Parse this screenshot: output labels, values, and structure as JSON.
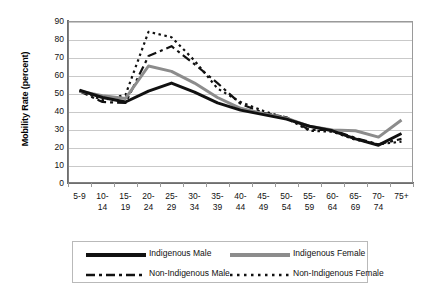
{
  "chart_data": {
    "type": "line",
    "title": "",
    "xlabel": "",
    "ylabel": "Mobility Rate (percent)",
    "ylim": [
      0,
      90
    ],
    "ytick_step": 10,
    "yticks": [
      90,
      80,
      70,
      60,
      50,
      40,
      30,
      20,
      10,
      0
    ],
    "grid": true,
    "legend_position": "bottom",
    "categories": [
      "5-9",
      "10-14",
      "15-19",
      "20-24",
      "25-29",
      "30-34",
      "35-39",
      "40-44",
      "45-49",
      "50-54",
      "55-59",
      "60-64",
      "65-69",
      "70-74",
      "75+"
    ],
    "category_lines": [
      [
        "5-9",
        ""
      ],
      [
        "10-",
        "14"
      ],
      [
        "15-",
        "19"
      ],
      [
        "20-",
        "24"
      ],
      [
        "25-",
        "29"
      ],
      [
        "30-",
        "34"
      ],
      [
        "35-",
        "39"
      ],
      [
        "40-",
        "44"
      ],
      [
        "45-",
        "49"
      ],
      [
        "50-",
        "54"
      ],
      [
        "55-",
        "59"
      ],
      [
        "60-",
        "64"
      ],
      [
        "65-",
        "69"
      ],
      [
        "70-",
        "74"
      ],
      [
        "75+",
        ""
      ]
    ],
    "series": [
      {
        "name": "Indigenous Male",
        "color": "#111111",
        "style": "solid",
        "width": 3,
        "values": [
          51.5,
          47.5,
          45.0,
          51.0,
          55.5,
          50.5,
          44.5,
          40.5,
          38.0,
          35.5,
          31.5,
          29.0,
          24.5,
          21.0,
          27.5
        ]
      },
      {
        "name": "Indigenous Female",
        "color": "#8c8c8c",
        "style": "solid",
        "width": 3,
        "values": [
          51.0,
          48.5,
          47.0,
          65.0,
          62.0,
          55.5,
          47.5,
          41.5,
          38.5,
          36.0,
          31.5,
          29.5,
          29.0,
          25.5,
          35.0
        ]
      },
      {
        "name": "Non-Indigenous Male",
        "color": "#111111",
        "style": "dashed",
        "width": 2.2,
        "values": [
          51.0,
          45.0,
          44.5,
          70.5,
          76.0,
          66.0,
          55.5,
          44.0,
          39.0,
          36.5,
          29.5,
          29.5,
          25.0,
          21.5,
          24.5
        ]
      },
      {
        "name": "Non-Indigenous Female",
        "color": "#111111",
        "style": "dotted",
        "width": 2.2,
        "values": [
          51.5,
          46.0,
          49.0,
          84.0,
          81.0,
          68.0,
          52.5,
          45.0,
          40.0,
          36.0,
          29.0,
          28.5,
          24.0,
          21.5,
          23.0
        ]
      }
    ]
  },
  "axis": {
    "y_title": "Mobility Rate (percent)"
  },
  "legend": {
    "items": [
      {
        "label": "Indigenous Male",
        "style": "solid",
        "color": "#111111"
      },
      {
        "label": "Indigenous Female",
        "style": "solid",
        "color": "#8c8c8c"
      },
      {
        "label": "Non-Indigenous Male",
        "style": "dashed",
        "color": "#111111"
      },
      {
        "label": "Non-Indigenous Female",
        "style": "dotted",
        "color": "#111111"
      }
    ]
  }
}
